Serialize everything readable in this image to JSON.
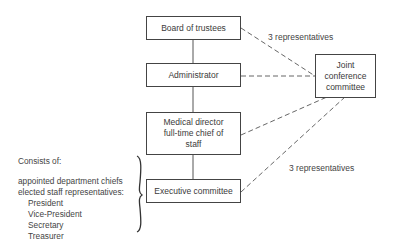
{
  "boxes": {
    "board": "Board of trustees",
    "administrator": "Administrator",
    "medical_line1": "Medical director",
    "medical_line2": "full-time chief of",
    "medical_line3": "staff",
    "executive": "Executive committee",
    "joint_line1": "Joint",
    "joint_line2": "conference",
    "joint_line3": "committee"
  },
  "edge_labels": {
    "top": "3 representatives",
    "bottom": "3 representatives"
  },
  "note": {
    "heading": "Consists of:",
    "items": [
      "appointed department chiefs",
      "elected staff representatives:",
      "President",
      "Vice-President",
      "Secretary",
      "Treasurer"
    ]
  }
}
